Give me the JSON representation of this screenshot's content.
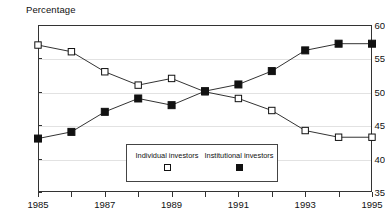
{
  "chart_data": {
    "type": "line",
    "title": "",
    "ylabel": "Percentage",
    "xlabel": "",
    "ylim": [
      35,
      60
    ],
    "yticks": [
      35,
      40,
      45,
      50,
      55,
      60
    ],
    "xlim": [
      1985,
      1995
    ],
    "xticks": [
      1985,
      1986,
      1987,
      1988,
      1989,
      1990,
      1991,
      1992,
      1993,
      1994,
      1995
    ],
    "xtick_labels": [
      "1985",
      "",
      "1987",
      "",
      "1989",
      "",
      "1991",
      "",
      "1993",
      "",
      "1995"
    ],
    "x": [
      1985,
      1986,
      1987,
      1988,
      1989,
      1990,
      1991,
      1992,
      1993,
      1994,
      1995
    ],
    "grid": true,
    "legend_position": "inside-bottom-center",
    "series": [
      {
        "name": "Individual investors",
        "marker": "open-square",
        "values": [
          57,
          56,
          53,
          51,
          52,
          50,
          49,
          47.2,
          44.2,
          43.2,
          43.2
        ]
      },
      {
        "name": "Institutional investors",
        "marker": "filled-square",
        "values": [
          43,
          44,
          47,
          49,
          48,
          50.1,
          51.1,
          53.1,
          56.2,
          57.2,
          57.2
        ]
      }
    ]
  },
  "colors": {
    "line": "#333333",
    "marker_fill_open": "#ffffff",
    "marker_fill_filled": "#111111",
    "grid": "#e2e2e2",
    "axis": "#333333",
    "text": "#111111"
  }
}
